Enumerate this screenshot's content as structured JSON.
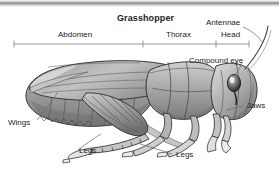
{
  "figure": {
    "title": "Grasshopper",
    "background_color": "#ffffff",
    "ink_color": "#1b1b1b",
    "rule_color": "#8c8c8c",
    "body_fill_light": "#d6d6d6",
    "body_fill_mid": "#a8a8a8",
    "body_fill_dark": "#6e6e6e",
    "outline_color": "#2b2b2b"
  },
  "top_bar": {
    "name": "decorative-top-rule",
    "color_dark": "#8a8a8a",
    "color_light": "#e8e8e8"
  },
  "scale_bar": {
    "label": "body-region-scale-bar",
    "start_x": 14,
    "end_x": 249,
    "y": 44,
    "ticks": [
      14,
      143,
      216,
      249
    ],
    "segments": [
      {
        "label": "Abdomen",
        "from_x": 14,
        "to_x": 143
      },
      {
        "label": "Thorax",
        "from_x": 143,
        "to_x": 216
      },
      {
        "label": "Head",
        "from_x": 216,
        "to_x": 249
      }
    ]
  },
  "labels": {
    "title": "Grasshopper",
    "abdomen": "Abdomen",
    "thorax": "Thorax",
    "head": "Head",
    "antennae": "Antennae",
    "compound_eye": "Compound eye",
    "jaws": "Jaws",
    "wings": "Wings",
    "legs_front": "Legs",
    "legs_hind": "Legs"
  },
  "callouts": [
    {
      "name": "antennae",
      "text": "Antennae",
      "text_x": 210,
      "text_y": 22,
      "leader_from": [
        244,
        26
      ],
      "leader_to": [
        262,
        42
      ]
    },
    {
      "name": "compound-eye",
      "text": "Compound eye",
      "text_x": 192,
      "text_y": 60,
      "leader_from": [
        240,
        64
      ],
      "leader_to": [
        232,
        76
      ]
    },
    {
      "name": "jaws",
      "text": "Jaws",
      "text_x": 245,
      "text_y": 104,
      "leader_from": [
        243,
        108
      ],
      "leader_to": [
        222,
        112
      ]
    },
    {
      "name": "wings",
      "text": "Wings",
      "text_x": 10,
      "text_y": 122,
      "leader_from": [
        38,
        120
      ],
      "leader_to": [
        58,
        92
      ]
    },
    {
      "name": "legs-front",
      "text": "Legs",
      "text_x": 77,
      "text_y": 155,
      "leader_from": [
        75,
        152
      ],
      "leader_to": [
        100,
        135
      ]
    },
    {
      "name": "legs-hind",
      "text": "Legs",
      "text_x": 175,
      "text_y": 157,
      "leader_from": [
        172,
        154
      ],
      "leader_to": [
        138,
        144
      ]
    }
  ]
}
